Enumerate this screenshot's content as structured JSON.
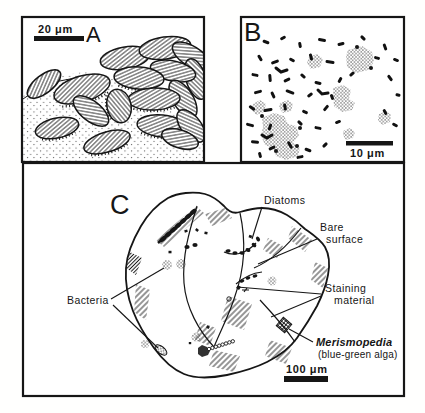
{
  "figure": {
    "colors": {
      "ink": "#161616",
      "paper": "#ffffff"
    },
    "panel_a": {
      "letter": "A",
      "scale_label": "20 μm"
    },
    "panel_b": {
      "letter": "B",
      "scale_label": "10 μm"
    },
    "panel_c": {
      "letter": "C",
      "scale_label": "100 μm",
      "labels": {
        "diatoms": "Diatoms",
        "bare_surface_1": "Bare",
        "bare_surface_2": "surface",
        "bacteria": "Bacteria",
        "staining_1": "Staining",
        "staining_2": "material",
        "merismopedia": "Merismopedia",
        "merismopedia_sub": "(blue-green alga)"
      }
    }
  }
}
